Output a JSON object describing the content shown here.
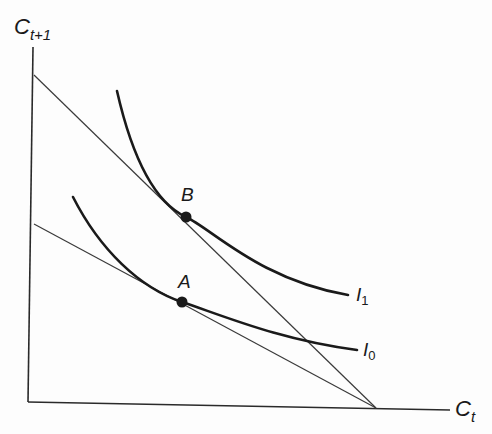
{
  "diagram": {
    "type": "intertemporal consumption choice (budget lines and indifference curves)",
    "axes": {
      "y": {
        "label_main": "C",
        "label_sub": "t+1"
      },
      "x": {
        "label_main": "C",
        "label_sub": "t"
      }
    },
    "budget_lines": [
      {
        "name": "upper-budget-line",
        "from": [
          34,
          75
        ],
        "to": [
          376,
          408
        ]
      },
      {
        "name": "lower-budget-line",
        "from": [
          34,
          224
        ],
        "to": [
          376,
          408
        ]
      }
    ],
    "indifference_curves": [
      {
        "name": "I1",
        "label_main": "I",
        "label_sub": "1"
      },
      {
        "name": "I0",
        "label_main": "I",
        "label_sub": "0"
      }
    ],
    "points": [
      {
        "name": "B",
        "label": "B"
      },
      {
        "name": "A",
        "label": "A"
      }
    ],
    "colors": {
      "line": "#1a1a1a",
      "thin_line": "#3a3a3a",
      "background": "#fdfdfd"
    }
  }
}
